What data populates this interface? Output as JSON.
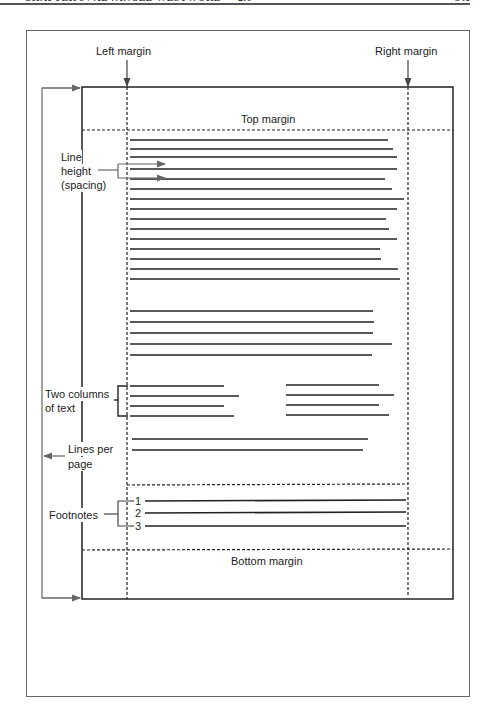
{
  "page_header": {
    "running_head": "CHAPTER 9 / ADVANCED WESTWORD — 2.0",
    "page_number": "341"
  },
  "diagram": {
    "labels": {
      "left_margin": "Left margin",
      "right_margin": "Right margin",
      "top_margin": "Top margin",
      "bottom_margin": "Bottom margin",
      "line_height_1": "Line",
      "line_height_2": "height",
      "line_height_3": "(spacing)",
      "two_columns_1": "Two columns",
      "two_columns_2": "of text",
      "lines_per_page_1": "Lines per",
      "lines_per_page_2": "page",
      "footnotes": "Footnotes"
    },
    "footnote_numbers": [
      "1",
      "2",
      "3"
    ],
    "colors": {
      "line": "#222222",
      "arrow": "#666666",
      "frame": "#666666"
    }
  }
}
